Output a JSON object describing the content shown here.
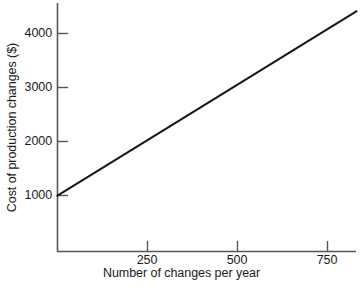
{
  "chart_data": {
    "type": "line",
    "title": "",
    "subtitle": "",
    "xlabel": "Number of changes per year",
    "ylabel": "Cost of production changes ($)",
    "xlim": [
      0,
      830
    ],
    "ylim": [
      0,
      4390
    ],
    "xticks": [
      250,
      500,
      750
    ],
    "xtick_labels": [
      "250",
      "500",
      "750"
    ],
    "yticks": [
      1000,
      2000,
      3000,
      4000
    ],
    "ytick_labels": [
      "1000",
      "2000",
      "3000",
      "4000"
    ],
    "grid": false,
    "legend": null,
    "legend_position": "none",
    "annotations": [],
    "series": [
      {
        "name": "Cost of production changes",
        "type": "line",
        "color": "#161616",
        "line_width": 2,
        "x": [
          0,
          250,
          500,
          750,
          830
        ],
        "y": [
          1000,
          2027,
          3055,
          4082,
          4411
        ]
      }
    ],
    "intercept": 1000,
    "slope": 4.11
  },
  "axes": {
    "x_title": "Number of changes per year",
    "y_title": "Cost of production changes ($)",
    "x_tick_labels": [
      "250",
      "500",
      "750"
    ],
    "y_tick_labels": [
      "1000",
      "2000",
      "3000",
      "4000"
    ],
    "axis_color": "#565656",
    "line_color": "#161616",
    "background": "#ffffff"
  }
}
